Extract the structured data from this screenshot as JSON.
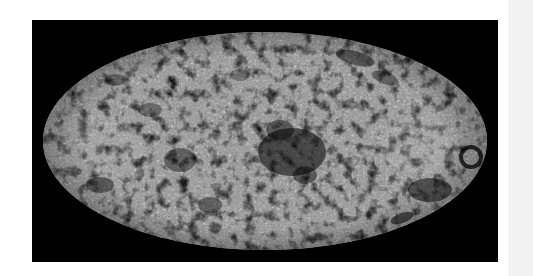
{
  "figure": {
    "kind": "full-sky map",
    "projection": "Mollweide (elliptical)",
    "colormap": "grayscale",
    "background_color": "#000000",
    "page_color": "#ffffff",
    "side_strip_color": "#f3f3f3",
    "map_base_color": "#5a5a5a",
    "cold_spot_color": "#050505",
    "hot_spot_color": "#c8c8c8",
    "frame": {
      "x": 32,
      "y": 20,
      "width": 466,
      "height": 242
    },
    "ellipse": {
      "cx": 265,
      "cy": 141,
      "rx": 222,
      "ry": 109
    },
    "features": [
      {
        "name": "central-cold-region",
        "x": 290,
        "y": 150,
        "description": "large dark cluster near center"
      },
      {
        "name": "left-hot-region",
        "x": 95,
        "y": 145,
        "description": "bright speckled band on left"
      },
      {
        "name": "right-hot-region",
        "x": 420,
        "y": 145,
        "description": "bright speckled area on right"
      },
      {
        "name": "right-edge-cold-ring",
        "x": 470,
        "y": 155,
        "description": "dark ring-like feature at right limb"
      },
      {
        "name": "upper-right-cold-streaks",
        "x": 360,
        "y": 60,
        "description": "dark elongated streaks near top-right"
      },
      {
        "name": "lower-right-cold-patch",
        "x": 430,
        "y": 195,
        "description": "dark patch near lower-right limb"
      },
      {
        "name": "lower-left-cold-patch",
        "x": 100,
        "y": 185,
        "description": "dark patches near lower-left"
      }
    ]
  }
}
